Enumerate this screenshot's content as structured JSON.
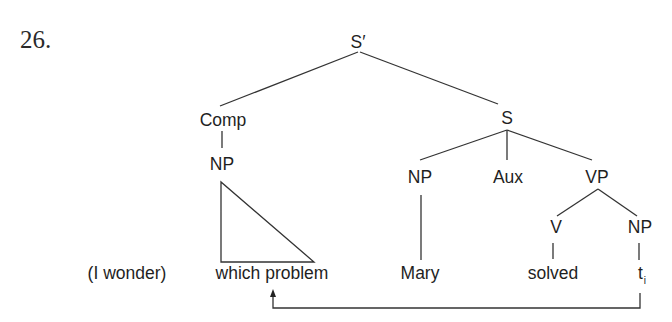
{
  "example_number": "26.",
  "tree": {
    "root": "S′",
    "comp": "Comp",
    "comp_np": "NP",
    "s": "S",
    "s_np": "NP",
    "aux": "Aux",
    "vp": "VP",
    "v": "V",
    "vp_np": "NP"
  },
  "terminals": {
    "prefix": "(I wonder)",
    "wh_phrase": "which problem",
    "subject": "Mary",
    "verb": "solved",
    "trace": "t",
    "trace_index": "i"
  }
}
